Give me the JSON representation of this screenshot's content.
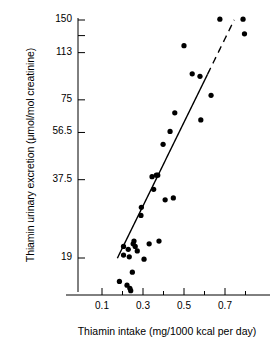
{
  "chart_data": {
    "type": "scatter",
    "title": "",
    "xlabel": "Thiamin intake (mg/1000 kcal per day)",
    "ylabel": "Thiamin urinary excretion (μmol/mol creatinine)",
    "xlim": [
      0.08,
      0.82
    ],
    "ylim": [
      14,
      160
    ],
    "yscale": "log",
    "xscale": "linear",
    "grid": false,
    "legend": null,
    "xticks": [
      {
        "value": 0.1,
        "label": "0.1",
        "major": true
      },
      {
        "value": 0.2,
        "label": "",
        "major": false
      },
      {
        "value": 0.3,
        "label": "0.3",
        "major": true
      },
      {
        "value": 0.4,
        "label": "",
        "major": false
      },
      {
        "value": 0.5,
        "label": "0.5",
        "major": true
      },
      {
        "value": 0.6,
        "label": "",
        "major": false
      },
      {
        "value": 0.7,
        "label": "0.7",
        "major": true
      },
      {
        "value": 0.8,
        "label": "",
        "major": false
      }
    ],
    "yticks": [
      {
        "value": 150,
        "label": "150"
      },
      {
        "value": 131,
        "label": ""
      },
      {
        "value": 113,
        "label": "113"
      },
      {
        "value": 75,
        "label": "75"
      },
      {
        "value": 56.5,
        "label": "56.5"
      },
      {
        "value": 37.5,
        "label": "37.5"
      },
      {
        "value": 19,
        "label": "19"
      }
    ],
    "points": [
      {
        "x": 0.185,
        "y": 15.5
      },
      {
        "x": 0.205,
        "y": 19.5
      },
      {
        "x": 0.205,
        "y": 21.0
      },
      {
        "x": 0.222,
        "y": 15.0
      },
      {
        "x": 0.228,
        "y": 20.5
      },
      {
        "x": 0.233,
        "y": 19.2
      },
      {
        "x": 0.236,
        "y": 14.6
      },
      {
        "x": 0.24,
        "y": 14.3
      },
      {
        "x": 0.248,
        "y": 16.8
      },
      {
        "x": 0.252,
        "y": 21.5
      },
      {
        "x": 0.256,
        "y": 22.0
      },
      {
        "x": 0.262,
        "y": 21.0
      },
      {
        "x": 0.272,
        "y": 20.2
      },
      {
        "x": 0.29,
        "y": 27.5
      },
      {
        "x": 0.292,
        "y": 29.5
      },
      {
        "x": 0.305,
        "y": 18.8
      },
      {
        "x": 0.33,
        "y": 21.5
      },
      {
        "x": 0.344,
        "y": 38.5
      },
      {
        "x": 0.352,
        "y": 34.5
      },
      {
        "x": 0.365,
        "y": 39.0
      },
      {
        "x": 0.372,
        "y": 39.0
      },
      {
        "x": 0.378,
        "y": 22.0
      },
      {
        "x": 0.398,
        "y": 51.0
      },
      {
        "x": 0.408,
        "y": 31.5
      },
      {
        "x": 0.432,
        "y": 57.0
      },
      {
        "x": 0.448,
        "y": 32.0
      },
      {
        "x": 0.455,
        "y": 67.0
      },
      {
        "x": 0.5,
        "y": 120.0
      },
      {
        "x": 0.54,
        "y": 94.0
      },
      {
        "x": 0.578,
        "y": 92.0
      },
      {
        "x": 0.582,
        "y": 63.0
      },
      {
        "x": 0.632,
        "y": 78.0
      },
      {
        "x": 0.675,
        "y": 151.0
      },
      {
        "x": 0.788,
        "y": 151.0
      },
      {
        "x": 0.795,
        "y": 133.0
      }
    ],
    "fit_curve": {
      "style_solid": "solid",
      "style_extension": "dashed",
      "solid_range": [
        0.175,
        0.615
      ],
      "dashed_range": [
        0.615,
        0.745
      ],
      "description": "fitted exponential regression curve, solid over data range and dashed extrapolation"
    },
    "marker": {
      "shape": "circle",
      "color": "#000000",
      "size": 4.2
    },
    "line_color": "#000000",
    "axis_color": "#000000"
  }
}
